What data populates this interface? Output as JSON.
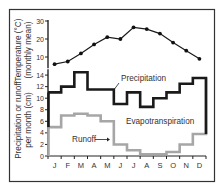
{
  "chart_data": [
    {
      "type": "line",
      "title": "",
      "ylabel": "Temperature (°C) (monthly mean)",
      "ylabel_lines": [
        "Temperature (°C)",
        "(monthly mean)"
      ],
      "xlabel": "",
      "categories": [
        "J",
        "F",
        "M",
        "A",
        "M",
        "J",
        "J",
        "A",
        "S",
        "O",
        "N",
        "D"
      ],
      "ylim": [
        5,
        30
      ],
      "yticks": [
        10,
        20,
        30
      ],
      "series": [
        {
          "name": "Temperature",
          "values": [
            6,
            7.5,
            12,
            17,
            21,
            20,
            26.5,
            25.5,
            23,
            18,
            13.5,
            9
          ]
        }
      ],
      "grid": false,
      "markers": true
    },
    {
      "type": "line",
      "step": true,
      "title": "",
      "ylabel": "Precipitation or runoff per month (cm)",
      "ylabel_lines": [
        "Precipitation or runoff",
        "per month (cm)"
      ],
      "xlabel": "",
      "categories": [
        "J",
        "F",
        "M",
        "A",
        "M",
        "J",
        "J",
        "A",
        "S",
        "O",
        "N",
        "D"
      ],
      "ylim": [
        0,
        15
      ],
      "yticks": [
        0,
        2,
        4,
        6,
        8,
        10,
        12,
        14
      ],
      "series": [
        {
          "name": "Precipitation",
          "color": "#1a1a1a",
          "values": [
            11,
            12,
            14.5,
            11.5,
            11.5,
            9,
            11,
            8.5,
            10,
            11,
            12.5,
            13.5
          ]
        },
        {
          "name": "Runoff",
          "color": "#a6a6a6",
          "values": [
            5,
            7,
            7.3,
            7,
            6,
            2,
            1,
            0.3,
            0.3,
            0.7,
            2,
            3.8
          ]
        }
      ],
      "annotations": [
        {
          "text": "Precipitation",
          "target": "Precipitation"
        },
        {
          "text": "Evapotranspiration",
          "target": "region between curves"
        },
        {
          "text": "Runoff",
          "target": "Runoff",
          "arrow": true
        }
      ],
      "grid": false,
      "legend": "none"
    }
  ],
  "labels": {
    "temp_axis_line1": "Temperature (°C)",
    "temp_axis_line2": "(monthly mean)",
    "precip_axis_line1": "Precipitation or runoff",
    "precip_axis_line2": "per month (cm)",
    "precipitation": "Precipitation",
    "evapotranspiration": "Evapotranspiration",
    "runoff": "Runoff"
  }
}
